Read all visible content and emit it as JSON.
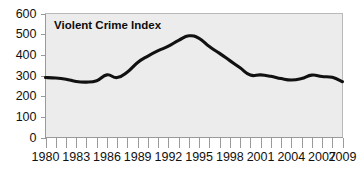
{
  "chart_data": {
    "type": "line",
    "title": "Violent Crime Index",
    "xlabel": "",
    "ylabel": "",
    "ylim": [
      0,
      600
    ],
    "xlim": [
      1980,
      2009
    ],
    "grid": false,
    "legend": "none",
    "background_color": "#ececec",
    "line_color": "#111111",
    "y_ticks": [
      600,
      500,
      400,
      300,
      200,
      100,
      0
    ],
    "x_ticks": [
      1980,
      1983,
      1986,
      1989,
      1992,
      1995,
      1998,
      2001,
      2004,
      2007,
      2009
    ],
    "x_tick_labels": [
      "1980",
      "1983",
      "1986",
      "1989",
      "1992",
      "1995",
      "1998",
      "2001",
      "2004",
      "2007",
      "2009"
    ],
    "y_tick_labels": [
      "600",
      "500",
      "400",
      "300",
      "200",
      "100",
      "0"
    ],
    "x_minor_ticks_every": 1,
    "series": [
      {
        "name": "Violent Crime Index",
        "x": [
          1980,
          1981,
          1982,
          1983,
          1984,
          1985,
          1986,
          1987,
          1988,
          1989,
          1990,
          1991,
          1992,
          1993,
          1994,
          1995,
          1996,
          1997,
          1998,
          1999,
          2000,
          2001,
          2002,
          2003,
          2004,
          2005,
          2006,
          2007,
          2008,
          2009
        ],
        "values": [
          290,
          288,
          282,
          271,
          268,
          275,
          303,
          290,
          317,
          363,
          394,
          420,
          442,
          470,
          492,
          480,
          440,
          407,
          372,
          337,
          302,
          303,
          296,
          285,
          278,
          285,
          302,
          295,
          291,
          270
        ]
      }
    ]
  }
}
